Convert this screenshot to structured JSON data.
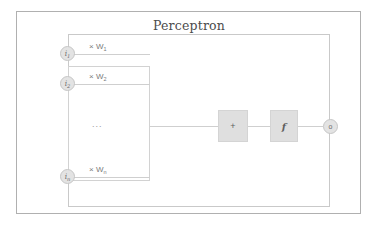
{
  "diagram": {
    "title": "Perceptron",
    "inputs": [
      {
        "node_label": "i",
        "node_subscript": "1",
        "weight_prefix": "× W",
        "weight_subscript": "1"
      },
      {
        "node_label": "i",
        "node_subscript": "2",
        "weight_prefix": "× W",
        "weight_subscript": "2"
      },
      {
        "node_label": "i",
        "node_subscript": "n",
        "weight_prefix": "× W",
        "weight_subscript": "n"
      }
    ],
    "ellipsis": "...",
    "summation_label": "+",
    "activation_label": "f",
    "output_label": "o",
    "colors": {
      "outer_frame": "#b0b0b0",
      "inner_frame": "#c9c9c9",
      "weights_frame": "#d2d2d2",
      "wire": "#cfcfcf",
      "node_fill": "#e3e3e3",
      "node_border": "#c6c6c6",
      "block_fill": "#dfdfdf",
      "block_border": "#d4d4d4",
      "text": "#6b6b6b",
      "title_text": "#4c4c4c",
      "background": "#ffffff"
    }
  }
}
